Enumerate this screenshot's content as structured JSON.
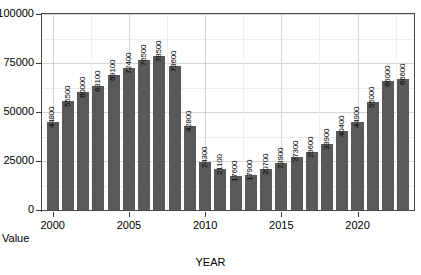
{
  "chart_data": {
    "type": "bar",
    "title": "",
    "xlabel": "YEAR",
    "ylabel": "Value",
    "categories": [
      2000,
      2001,
      2002,
      2003,
      2004,
      2005,
      2006,
      2007,
      2008,
      2009,
      2010,
      2011,
      2012,
      2013,
      2014,
      2015,
      2016,
      2017,
      2018,
      2019,
      2020,
      2021,
      2022,
      2023
    ],
    "values": [
      44800,
      55500,
      60000,
      63100,
      69100,
      72400,
      76500,
      78500,
      73600,
      42800,
      24300,
      21100,
      17600,
      17900,
      20700,
      23900,
      27300,
      29600,
      33900,
      40400,
      44900,
      55000,
      66000,
      66600
    ],
    "data_labels": [
      "44800",
      "55500",
      "60000",
      "63100",
      "69100",
      "72400",
      "76500",
      "78500",
      "73600",
      "42800",
      "24300",
      "21100",
      "17600",
      "17900",
      "20700",
      "23900",
      "27300",
      "29600",
      "33900",
      "40400",
      "44900",
      "55000",
      "66000",
      "66600"
    ],
    "ylim": [
      0,
      100000
    ],
    "xlim": [
      1999.3,
      2023.7
    ],
    "ytick_labels": [
      "0",
      "25000",
      "50000",
      "75000",
      "100000"
    ],
    "ytick_values": [
      0,
      25000,
      50000,
      75000,
      100000
    ],
    "yminor_values": [
      12500,
      37500,
      62500,
      87500
    ],
    "xtick_labels": [
      "2000",
      "2005",
      "2010",
      "2015",
      "2020"
    ],
    "xtick_values": [
      2000,
      2005,
      2010,
      2015,
      2020
    ],
    "xminor_values": [
      2002.5,
      2007.5,
      2012.5,
      2017.5,
      2022.5
    ],
    "grid": true,
    "legend": "none",
    "bar_color": "#595959",
    "grid_color": "#d6d6d6",
    "frame_color": "#4a4a4a",
    "background_color": "#ffffff"
  }
}
